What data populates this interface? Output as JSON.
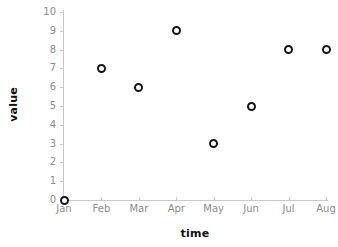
{
  "chart_data": {
    "type": "scatter",
    "title": "",
    "xlabel": "time",
    "ylabel": "value",
    "categories": [
      "Jan",
      "Feb",
      "Mar",
      "Apr",
      "May",
      "Jun",
      "Jul",
      "Aug"
    ],
    "values": [
      0,
      7,
      6,
      9,
      3,
      5,
      8,
      8
    ],
    "series": [
      {
        "name": "value",
        "values": [
          0,
          7,
          6,
          9,
          3,
          5,
          8,
          8
        ]
      }
    ],
    "points": [
      {
        "x": "Jan",
        "y": 0
      },
      {
        "x": "Feb",
        "y": 7
      },
      {
        "x": "Mar",
        "y": 6
      },
      {
        "x": "Apr",
        "y": 9
      },
      {
        "x": "May",
        "y": 3
      },
      {
        "x": "Jun",
        "y": 5
      },
      {
        "x": "Jul",
        "y": 8
      },
      {
        "x": "Aug",
        "y": 8
      }
    ],
    "ylim": [
      0,
      10
    ],
    "yticks": [
      0,
      1,
      2,
      3,
      4,
      5,
      6,
      7,
      8,
      9,
      10
    ],
    "ytick_labels": [
      "0",
      "1",
      "2",
      "3",
      "4",
      "5",
      "6",
      "7",
      "8",
      "9",
      "10"
    ],
    "xtick_labels": [
      "Jan",
      "Feb",
      "Mar",
      "Apr",
      "May",
      "Jun",
      "Jul",
      "Aug"
    ],
    "grid": false,
    "legend": false,
    "legend_position": "none",
    "marker_style": "open-circle",
    "colors": {
      "marker_stroke": "#151515",
      "marker_fill": "#ffffff",
      "axis_line": "#c9c9c9",
      "tick_label": "#8c8c8c",
      "axis_title": "#111111",
      "background": "#ffffff"
    }
  }
}
